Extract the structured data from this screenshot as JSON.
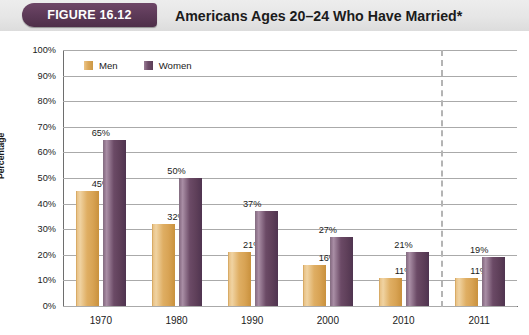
{
  "header": {
    "badge_label": "FIGURE 16.12",
    "title": "Americans Ages 20–24 Who Have Married*"
  },
  "colors": {
    "badge": "#5d3a58",
    "header_band": "#e6e6e6",
    "men": "#dca95c",
    "women": "#6b4a66",
    "gridline": "#aaaaaa",
    "axis": "#6e6e6e",
    "divider": "#b4b4b4"
  },
  "chart_data": {
    "type": "bar",
    "title": "Americans Ages 20–24 Who Have Married*",
    "xlabel": "",
    "ylabel": "Percentage",
    "ylim": [
      0,
      100
    ],
    "yticks": [
      "0%",
      "10%",
      "20%",
      "30%",
      "40%",
      "50%",
      "60%",
      "70%",
      "80%",
      "90%",
      "100%"
    ],
    "grid": true,
    "legend_position": "top-left",
    "categories": [
      "1970",
      "1980",
      "1990",
      "2000",
      "2010",
      "2011"
    ],
    "series": [
      {
        "name": "Men",
        "values": [
          45,
          32,
          21,
          16,
          11,
          11
        ],
        "labels": [
          "45%",
          "32%",
          "21%",
          "16%",
          "11%",
          "11%"
        ]
      },
      {
        "name": "Women",
        "values": [
          65,
          50,
          37,
          27,
          21,
          19
        ],
        "labels": [
          "65%",
          "50%",
          "37%",
          "27%",
          "21%",
          "19%"
        ]
      }
    ],
    "annotations": [
      {
        "type": "vertical-dashed-line",
        "after_category": "2010"
      }
    ]
  }
}
